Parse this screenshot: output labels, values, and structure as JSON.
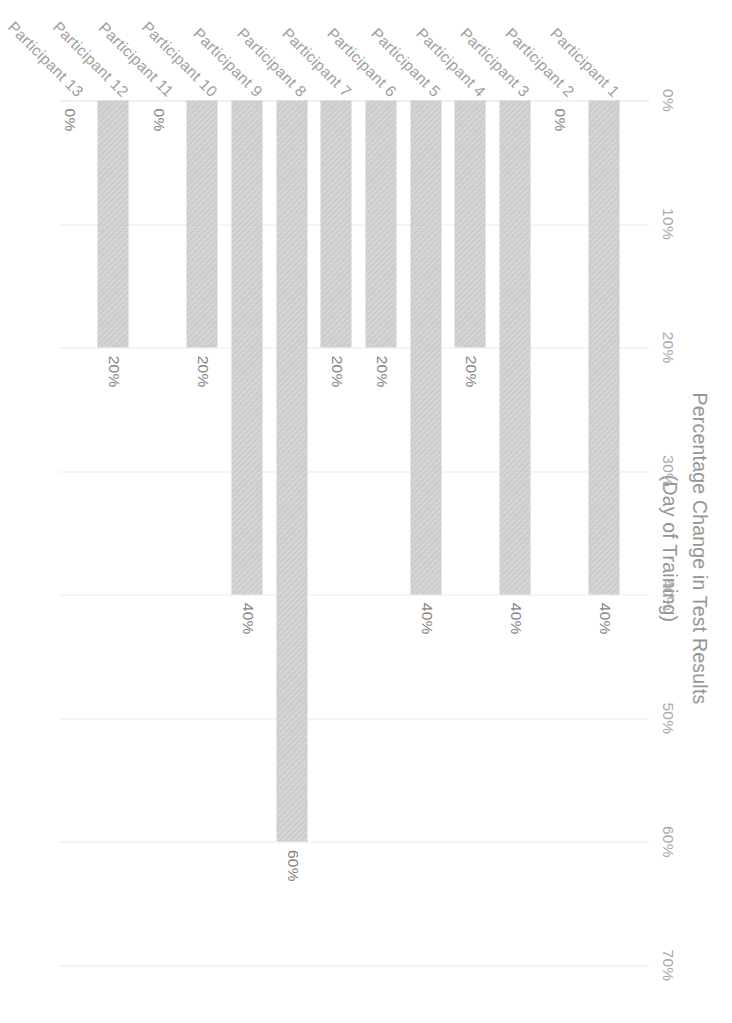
{
  "chart_data": {
    "type": "bar",
    "orientation": "horizontal",
    "title": "Percentage Change in Test Results",
    "subtitle": "(Day of Training)",
    "xlabel": "",
    "ylabel": "",
    "xlim": [
      0,
      70
    ],
    "grid": true,
    "legend": "none",
    "categories": [
      "Participant 1",
      "Participant 2",
      "Participant 3",
      "Participant 4",
      "Participant 5",
      "Participant 6",
      "Participant 7",
      "Participant 8",
      "Participant 9",
      "Participant 10",
      "Participant 11",
      "Participant 12",
      "Participant 13"
    ],
    "values": [
      40,
      0,
      40,
      20,
      40,
      20,
      20,
      60,
      40,
      20,
      0,
      20,
      0
    ],
    "value_labels": [
      "40%",
      "0%",
      "40%",
      "20%",
      "40%",
      "20%",
      "20%",
      "60%",
      "40%",
      "20%",
      "0%",
      "20%",
      "0%"
    ],
    "x_ticks": [
      0,
      10,
      20,
      30,
      40,
      50,
      60,
      70
    ],
    "x_tick_labels": [
      "0%",
      "10%",
      "20%",
      "30%",
      "40%",
      "50%",
      "60%",
      "70%"
    ],
    "bar_color": "#c6c6c7",
    "gridline_color": "#ececed",
    "text_color": "#9a9a9b",
    "background_color": "#ffffff"
  },
  "figure": {
    "title_line1": "Percentage Change in Test Results",
    "title_line2": "(Day of Training)"
  }
}
